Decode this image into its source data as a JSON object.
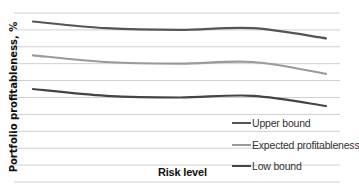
{
  "chart_data": {
    "type": "line",
    "title": "",
    "xlabel": "Risk level",
    "ylabel": "Portfolio profitableness, %",
    "x": [
      1,
      2,
      3,
      4,
      5
    ],
    "series": [
      {
        "name": "Upper bound",
        "color": "#555555",
        "values": [
          9.5,
          9.1,
          9.0,
          9.1,
          8.5
        ]
      },
      {
        "name": "Expected profitableness",
        "color": "#9a9a9a",
        "values": [
          7.5,
          7.1,
          7.0,
          7.1,
          6.4
        ]
      },
      {
        "name": "Low bound",
        "color": "#444444",
        "values": [
          5.5,
          5.1,
          5.0,
          5.1,
          4.5
        ]
      }
    ],
    "ylim": [
      0,
      10
    ],
    "grid": true,
    "gridlines": 11,
    "axis_ticks_visible": false,
    "legend_position": "lower-right"
  },
  "axes": {
    "ylabel": "Portfolio profitableness, %",
    "xlabel": "Risk level"
  },
  "legend": [
    {
      "label": "Upper bound",
      "color": "#555555"
    },
    {
      "label": "Expected profitableness",
      "color": "#9a9a9a"
    },
    {
      "label": "Low bound",
      "color": "#444444"
    }
  ]
}
